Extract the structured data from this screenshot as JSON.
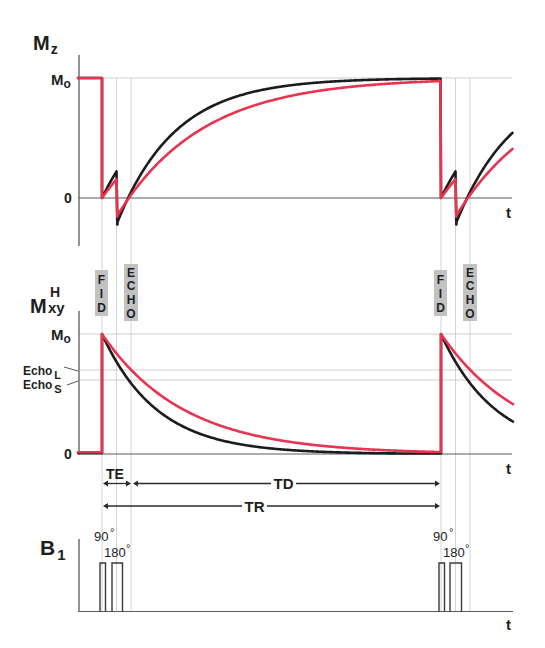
{
  "chart_data": {
    "type": "line",
    "colors": {
      "short_T": "#1c1c1c",
      "long_T": "#e8344e",
      "grid": "#cfcfcf",
      "axis": "#4a4a4a",
      "marker_box": "#c2c2c2"
    },
    "time_axis": {
      "label": "t",
      "units": "a.u.",
      "FID_times": [
        0,
        339
      ],
      "pulse180_offset": 14.5,
      "TE": 29,
      "TR": 339,
      "range": [
        -24,
        411
      ]
    },
    "panels": [
      {
        "name": "Mz",
        "ylabel": "Mz",
        "yticks": [
          "0",
          "Mo"
        ],
        "ylim": [
          -0.4,
          1.15
        ],
        "model": "inversion after 180° pulse, recovery 1-(1+m0)exp(-(t-TE/2)/T1)",
        "series": [
          {
            "name": "short T1 tissue",
            "color": "#1c1c1c",
            "T1": 58,
            "points": [
              [
                -24,
                1
              ],
              [
                0,
                1
              ],
              [
                0,
                0
              ],
              [
                14.5,
                0.221
              ],
              [
                14.5,
                -0.221
              ],
              [
                29,
                0.049
              ],
              [
                50,
                0.338
              ],
              [
                100,
                0.72
              ],
              [
                150,
                0.882
              ],
              [
                200,
                0.95
              ],
              [
                250,
                0.979
              ],
              [
                300,
                0.991
              ],
              [
                339,
                0.995
              ],
              [
                339,
                0
              ],
              [
                353.5,
                0.221
              ],
              [
                353.5,
                -0.221
              ],
              [
                368,
                0.049
              ],
              [
                411,
                0.55
              ]
            ]
          },
          {
            "name": "long T1 tissue",
            "color": "#e8344e",
            "T1": 85,
            "points": [
              [
                -24,
                1
              ],
              [
                0,
                1
              ],
              [
                0,
                0
              ],
              [
                14.5,
                0.157
              ],
              [
                14.5,
                -0.157
              ],
              [
                29,
                0.024
              ],
              [
                50,
                0.238
              ],
              [
                100,
                0.577
              ],
              [
                150,
                0.765
              ],
              [
                200,
                0.87
              ],
              [
                250,
                0.927
              ],
              [
                300,
                0.96
              ],
              [
                339,
                0.975
              ],
              [
                339,
                0
              ],
              [
                353.5,
                0.157
              ],
              [
                353.5,
                -0.157
              ],
              [
                368,
                0.024
              ],
              [
                411,
                0.43
              ]
            ]
          }
        ]
      },
      {
        "name": "Mxy",
        "ylabel": "Mxy (H)",
        "yticks": [
          "0",
          "Echo S",
          "Echo L",
          "Mo"
        ],
        "ylim": [
          0,
          1.15
        ],
        "echo_levels": {
          "Echo_L": 0.7,
          "Echo_S": 0.62
        },
        "model": "transverse decay exp(-t/T2)",
        "series": [
          {
            "name": "short T2 tissue",
            "color": "#1c1c1c",
            "T2": 55,
            "baseline": 0.008,
            "points": [
              [
                -24,
                0.008
              ],
              [
                0,
                0.008
              ],
              [
                0,
                1
              ],
              [
                29,
                0.59
              ],
              [
                50,
                0.403
              ],
              [
                100,
                0.162
              ],
              [
                150,
                0.065
              ],
              [
                200,
                0.026
              ],
              [
                250,
                0.011
              ],
              [
                300,
                0.004
              ],
              [
                339,
                0.002
              ],
              [
                339,
                1
              ],
              [
                368,
                0.59
              ],
              [
                411,
                0.27
              ]
            ]
          },
          {
            "name": "long T2 tissue",
            "color": "#e8344e",
            "T2": 82,
            "baseline": 0.015,
            "points": [
              [
                -24,
                0.015
              ],
              [
                0,
                0.015
              ],
              [
                0,
                1
              ],
              [
                29,
                0.7
              ],
              [
                50,
                0.544
              ],
              [
                100,
                0.296
              ],
              [
                150,
                0.16
              ],
              [
                200,
                0.087
              ],
              [
                250,
                0.047
              ],
              [
                300,
                0.026
              ],
              [
                339,
                0.016
              ],
              [
                339,
                1
              ],
              [
                368,
                0.7
              ],
              [
                411,
                0.42
              ]
            ]
          }
        ]
      },
      {
        "name": "B1",
        "ylabel": "B1",
        "pulses": [
          {
            "label": "90 °",
            "start": -2,
            "end": 3.5
          },
          {
            "label": "180 °",
            "start": 10,
            "end": 20.5
          },
          {
            "label": "90 °",
            "start": 337,
            "end": 342.5
          },
          {
            "label": "180 °",
            "start": 348,
            "end": 359.5
          }
        ]
      }
    ],
    "annotations": [
      "FID",
      "ECHO",
      "TE",
      "TD",
      "TR"
    ]
  },
  "labels": {
    "mz": {
      "main": "M",
      "sub": "z",
      "mo_main": "M",
      "mo_sub": "o",
      "zero": "0",
      "t": "t"
    },
    "mxy": {
      "main": "M",
      "sup": "H",
      "sub": "xy",
      "mo_main": "M",
      "mo_sub": "o",
      "echo_l": "Echo",
      "echo_l_sub": "L",
      "echo_s": "Echo",
      "echo_s_sub": "S",
      "zero": "0",
      "t": "t"
    },
    "markers": {
      "fid": [
        "F",
        "I",
        "D"
      ],
      "echo": [
        "E",
        "C",
        "H",
        "O"
      ]
    },
    "intervals": {
      "te": "TE",
      "td": "TD",
      "tr": "TR"
    },
    "b1": {
      "main": "B",
      "sub": "1",
      "p90": "90",
      "p180": "180",
      "deg": "°",
      "t": "t"
    }
  }
}
